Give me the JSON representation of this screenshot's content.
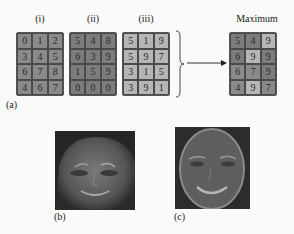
{
  "panel_a": {
    "label": "(a)",
    "grids": [
      {
        "label": "(i)",
        "shade": "c-i",
        "values": [
          [
            0,
            1,
            2
          ],
          [
            3,
            4,
            5
          ],
          [
            6,
            7,
            8
          ],
          [
            4,
            6,
            7
          ]
        ]
      },
      {
        "label": "(ii)",
        "shade": "c-ii",
        "values": [
          [
            5,
            4,
            8
          ],
          [
            6,
            3,
            9
          ],
          [
            1,
            5,
            9
          ],
          [
            0,
            0,
            0
          ]
        ]
      },
      {
        "label": "(iii)",
        "shade": "c-iii",
        "values": [
          [
            5,
            1,
            9
          ],
          [
            5,
            9,
            7
          ],
          [
            3,
            1,
            5
          ],
          [
            3,
            9,
            1
          ]
        ]
      }
    ],
    "result": {
      "label": "Maximum",
      "values": [
        [
          5,
          4,
          9
        ],
        [
          6,
          9,
          9
        ],
        [
          6,
          7,
          9
        ],
        [
          4,
          9,
          7
        ]
      ],
      "sources": [
        [
          "ii",
          "ii",
          "iii"
        ],
        [
          "ii",
          "iii",
          "ii"
        ],
        [
          "i",
          "i",
          "ii"
        ],
        [
          "i",
          "iii",
          "i"
        ]
      ]
    },
    "colors": {
      "grid_i": "#8a8a8a",
      "grid_ii": "#7c7c7c",
      "grid_iii": "#b6b6b6"
    }
  },
  "panel_b": {
    "label": "(b)",
    "image": "grayscale-face-photo"
  },
  "panel_c": {
    "label": "(c)",
    "image": "grayscale-face-edge-map"
  }
}
